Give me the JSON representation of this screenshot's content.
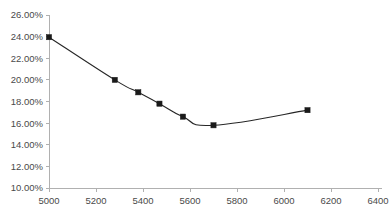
{
  "chart_data": {
    "type": "line",
    "title": "",
    "subtitle": "",
    "xlabel": "",
    "ylabel": "",
    "xlim": [
      4900,
      6500
    ],
    "ylim": [
      0.1,
      0.26
    ],
    "grid": false,
    "legend": null,
    "x_ticks": [
      5000,
      5200,
      5400,
      5600,
      5800,
      6000,
      6200,
      6400
    ],
    "x_tick_labels": [
      "5000",
      "5200",
      "5400",
      "5600",
      "5800",
      "6000",
      "6200",
      "6400"
    ],
    "y_ticks": [
      0.1,
      0.12,
      0.14,
      0.16,
      0.18,
      0.2,
      0.22,
      0.24,
      0.26
    ],
    "y_tick_labels": [
      "10.00%",
      "12.00%",
      "14.00%",
      "16.00%",
      "18.00%",
      "20.00%",
      "22.00%",
      "24.00%",
      "26.00%"
    ],
    "series": [
      {
        "name": "series-1",
        "color": "#1a1a1a",
        "marker": "square",
        "x": [
          5000,
          5280,
          5380,
          5470,
          5570,
          5700,
          6100
        ],
        "y": [
          0.2395,
          0.2,
          0.1885,
          0.178,
          0.166,
          0.158,
          0.172
        ],
        "y_labels": [
          "23.95%",
          "20.00%",
          "18.85%",
          "17.80%",
          "16.60%",
          "15.80%",
          "17.20%"
        ]
      }
    ]
  },
  "axis": {
    "y_axis_name": "percentage-axis",
    "x_axis_name": "value-axis"
  }
}
